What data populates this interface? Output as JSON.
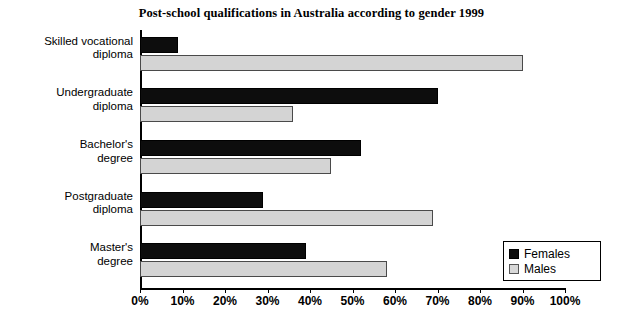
{
  "chart_data": {
    "type": "bar",
    "orientation": "horizontal",
    "title": "Post-school qualifications in Australia according to gender 1999",
    "categories": [
      "Skilled vocational\ndiploma",
      "Undergraduate\ndiploma",
      "Bachelor's\ndegree",
      "Postgraduate\ndiploma",
      "Master's\ndegree"
    ],
    "category_lines": [
      [
        "Skilled vocational",
        "diploma"
      ],
      [
        "Undergraduate",
        "diploma"
      ],
      [
        "Bachelor's",
        "degree"
      ],
      [
        "Postgraduate",
        "diploma"
      ],
      [
        "Master's",
        "degree"
      ]
    ],
    "series": [
      {
        "name": "Females",
        "color": "#0d0d0d",
        "values": [
          9,
          70,
          52,
          29,
          39
        ]
      },
      {
        "name": "Males",
        "color": "#d4d4d4",
        "values": [
          90,
          36,
          45,
          69,
          58
        ]
      }
    ],
    "xlabel": "",
    "ylabel": "",
    "xlim": [
      0,
      100
    ],
    "xticks": [
      0,
      10,
      20,
      30,
      40,
      50,
      60,
      70,
      80,
      90,
      100
    ],
    "xtick_labels": [
      "0%",
      "10%",
      "20%",
      "30%",
      "40%",
      "50%",
      "60%",
      "70%",
      "80%",
      "90%",
      "100%"
    ],
    "grid": false,
    "legend_position": "bottom-right",
    "legend_entries": [
      "Females",
      "Males"
    ]
  }
}
